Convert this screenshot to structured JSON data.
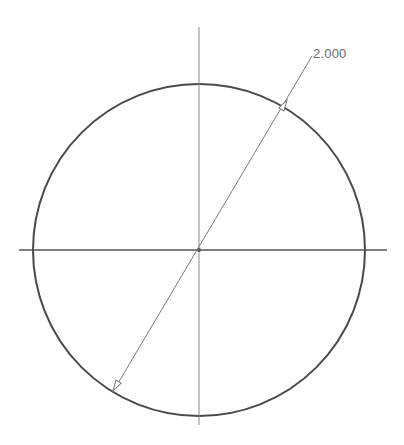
{
  "drawing": {
    "type": "circle-sketch",
    "center": {
      "x": 199,
      "y": 250
    },
    "radius": 167,
    "colors": {
      "circle": "#4a4a4a",
      "centerline": "#8a8a8a",
      "dimension": "#7a7a7a",
      "text": "#6a6a6a"
    }
  },
  "dimension": {
    "label": "2.000",
    "type": "diameter"
  }
}
